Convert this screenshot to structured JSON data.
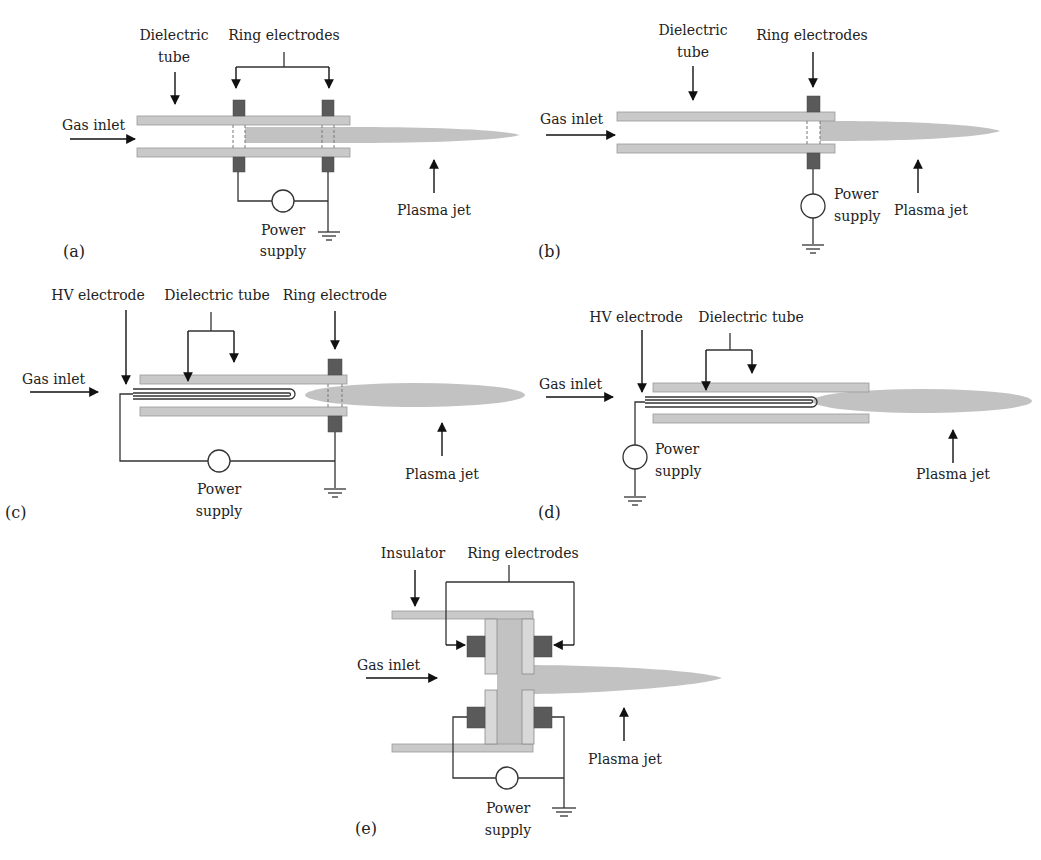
{
  "figure": {
    "panels": [
      {
        "id": "a",
        "tag": "(a)",
        "labels": {
          "dielectric_line1": "Dielectric",
          "dielectric_line2": "tube",
          "electrodes": "Ring electrodes",
          "gas": "Gas inlet",
          "power_line1": "Power",
          "power_line2": "supply",
          "jet": "Plasma jet"
        }
      },
      {
        "id": "b",
        "tag": "(b)",
        "labels": {
          "dielectric_line1": "Dielectric",
          "dielectric_line2": "tube",
          "electrodes": "Ring electrodes",
          "gas": "Gas inlet",
          "power_line1": "Power",
          "power_line2": "supply",
          "jet": "Plasma jet"
        }
      },
      {
        "id": "c",
        "tag": "(c)",
        "labels": {
          "hv": "HV electrode",
          "dielectric": "Dielectric tube",
          "electrode": "Ring electrode",
          "gas": "Gas inlet",
          "power_line1": "Power",
          "power_line2": "supply",
          "jet": "Plasma jet"
        }
      },
      {
        "id": "d",
        "tag": "(d)",
        "labels": {
          "hv": "HV electrode",
          "dielectric": "Dielectric tube",
          "gas": "Gas inlet",
          "power_line1": "Power",
          "power_line2": "supply",
          "jet": "Plasma jet"
        }
      },
      {
        "id": "e",
        "tag": "(e)",
        "labels": {
          "insulator": "Insulator",
          "electrodes": "Ring electrodes",
          "gas": "Gas inlet",
          "power_line1": "Power",
          "power_line2": "supply",
          "jet": "Plasma jet"
        }
      }
    ]
  },
  "colors": {
    "tube": "#c9c9c9",
    "electrode": "#5a5a5a",
    "plasma": "#c2c2c2",
    "wire": "#333333"
  }
}
